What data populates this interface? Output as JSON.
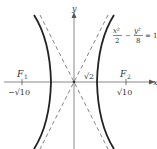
{
  "figure": {
    "equation": {
      "x_num": "x²",
      "x_den": "2",
      "minus": "−",
      "y_num": "y²",
      "y_den": "8",
      "equals": "= 1"
    },
    "axes": {
      "x_label": "x",
      "y_label": "y"
    },
    "foci": [
      {
        "name": "F",
        "sub": "1",
        "value": "−√10"
      },
      {
        "name": "F",
        "sub": "2",
        "value": "√10"
      }
    ],
    "vertex_label": "√2",
    "colors": {
      "curve": "#222222",
      "axis": "#888888",
      "asymptote": "#777777",
      "text": "#333333"
    }
  }
}
